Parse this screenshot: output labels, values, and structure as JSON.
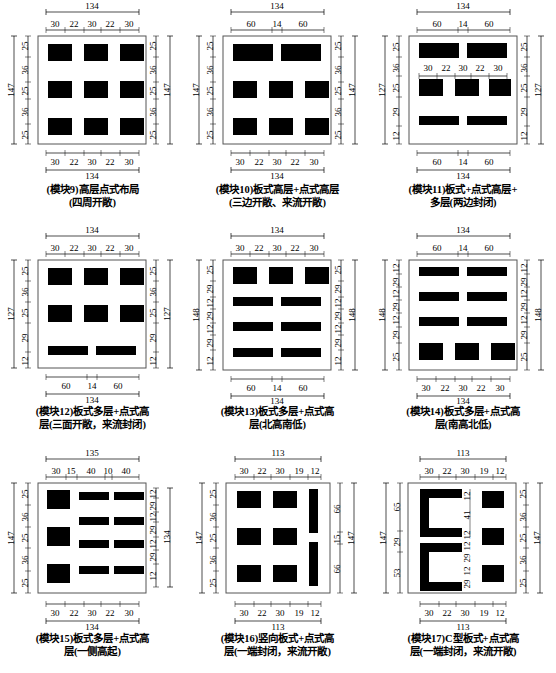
{
  "figure": {
    "type": "technical-diagram",
    "rows": 3,
    "cols": 3
  },
  "modules": [
    {
      "id": "module-9",
      "caption_line1": "(模块9)高层点式布局",
      "caption_line2": "(四周开敞)",
      "top_total": "134",
      "top_segments": [
        "30",
        "22",
        "30",
        "22",
        "30"
      ],
      "bottom_total": "134",
      "bottom_segments": [
        "30",
        "22",
        "30",
        "22",
        "30"
      ],
      "left_total": "147",
      "left_segments": [
        "25",
        "36",
        "25",
        "36",
        "25"
      ],
      "right_total": "147",
      "right_segments": [
        "25",
        "36",
        "25",
        "36",
        "25"
      ],
      "blocks": [
        {
          "x": 10,
          "y": 8,
          "w": 24,
          "h": 17
        },
        {
          "x": 46,
          "y": 8,
          "w": 24,
          "h": 17
        },
        {
          "x": 82,
          "y": 8,
          "w": 24,
          "h": 17
        },
        {
          "x": 10,
          "y": 45,
          "w": 24,
          "h": 17
        },
        {
          "x": 46,
          "y": 45,
          "w": 24,
          "h": 17
        },
        {
          "x": 82,
          "y": 45,
          "w": 24,
          "h": 17
        },
        {
          "x": 10,
          "y": 82,
          "w": 24,
          "h": 17
        },
        {
          "x": 46,
          "y": 82,
          "w": 24,
          "h": 17
        },
        {
          "x": 82,
          "y": 82,
          "w": 24,
          "h": 17
        }
      ]
    },
    {
      "id": "module-10",
      "caption_line1": "(模块10)板式高层+点式高层",
      "caption_line2": "(三边开敞、来流开敞)",
      "top_total": "134",
      "top_segments": [
        "60",
        "14",
        "60"
      ],
      "bottom_total": "134",
      "bottom_segments": [
        "30",
        "22",
        "30",
        "22",
        "30"
      ],
      "left_total": "147",
      "left_segments": [
        "25",
        "36",
        "25",
        "36",
        "25"
      ],
      "right_total": "147",
      "right_segments": [
        "25",
        "36",
        "25",
        "36",
        "25"
      ],
      "blocks": [
        {
          "x": 10,
          "y": 8,
          "w": 49,
          "h": 17
        },
        {
          "x": 66,
          "y": 8,
          "w": 49,
          "h": 17
        },
        {
          "x": 10,
          "y": 45,
          "w": 24,
          "h": 17
        },
        {
          "x": 46,
          "y": 45,
          "w": 24,
          "h": 17
        },
        {
          "x": 82,
          "y": 45,
          "w": 24,
          "h": 17
        },
        {
          "x": 10,
          "y": 82,
          "w": 24,
          "h": 17
        },
        {
          "x": 46,
          "y": 82,
          "w": 24,
          "h": 17
        },
        {
          "x": 82,
          "y": 82,
          "w": 24,
          "h": 17
        }
      ]
    },
    {
      "id": "module-11",
      "caption_line1": "(模块11)板式+点式高层+",
      "caption_line2": "多层(两边封闭)",
      "top_total": "134",
      "top_segments": [
        "60",
        "14",
        "60"
      ],
      "bottom_total": "134",
      "bottom_segments": [
        "60",
        "14",
        "60"
      ],
      "left_total": "127",
      "left_segments": [
        "25",
        "36",
        "25",
        "29",
        "12"
      ],
      "right_total": "127",
      "right_segments": [
        "25",
        "36",
        "25",
        "29",
        "12"
      ],
      "inner_segments": [
        "30",
        "22",
        "30",
        "22",
        "30"
      ],
      "blocks": [
        {
          "x": 10,
          "y": 8,
          "w": 49,
          "h": 15
        },
        {
          "x": 66,
          "y": 8,
          "w": 49,
          "h": 15
        },
        {
          "x": 10,
          "y": 44,
          "w": 24,
          "h": 17
        },
        {
          "x": 46,
          "y": 44,
          "w": 24,
          "h": 17
        },
        {
          "x": 82,
          "y": 44,
          "w": 24,
          "h": 17
        },
        {
          "x": 10,
          "y": 80,
          "w": 49,
          "h": 9
        },
        {
          "x": 66,
          "y": 80,
          "w": 49,
          "h": 9
        }
      ]
    },
    {
      "id": "module-12",
      "caption_line1": "(模块12)板式多层+点式高",
      "caption_line2": "层(三面开敞，来流封闭)",
      "top_total": "134",
      "top_segments": [
        "30",
        "22",
        "30",
        "22",
        "30"
      ],
      "bottom_total": "134",
      "bottom_segments": [
        "60",
        "14",
        "60"
      ],
      "left_total": "127",
      "left_segments": [
        "25",
        "36",
        "25",
        "29",
        "12"
      ],
      "right_total": "127",
      "right_segments": [
        "25",
        "36",
        "25",
        "29",
        "12"
      ],
      "blocks": [
        {
          "x": 10,
          "y": 8,
          "w": 24,
          "h": 17
        },
        {
          "x": 46,
          "y": 8,
          "w": 24,
          "h": 17
        },
        {
          "x": 82,
          "y": 8,
          "w": 24,
          "h": 17
        },
        {
          "x": 10,
          "y": 45,
          "w": 24,
          "h": 17
        },
        {
          "x": 46,
          "y": 45,
          "w": 24,
          "h": 17
        },
        {
          "x": 82,
          "y": 45,
          "w": 24,
          "h": 17
        },
        {
          "x": 10,
          "y": 84,
          "w": 49,
          "h": 9
        },
        {
          "x": 66,
          "y": 84,
          "w": 49,
          "h": 9
        }
      ]
    },
    {
      "id": "module-13",
      "caption_line1": "(模块13)板式多层+点式高",
      "caption_line2": "层(北高南低)",
      "top_total": "134",
      "top_segments": [
        "30",
        "22",
        "30",
        "22",
        "30"
      ],
      "bottom_total": "134",
      "bottom_segments": [
        "60",
        "14",
        "60"
      ],
      "left_total": "148",
      "left_segments": [
        "25",
        "29",
        "12",
        "29",
        "12",
        "29",
        "12"
      ],
      "right_total": "148",
      "right_segments": [
        "25",
        "29",
        "12",
        "29",
        "12",
        "29",
        "12"
      ],
      "blocks": [
        {
          "x": 10,
          "y": 7,
          "w": 24,
          "h": 17
        },
        {
          "x": 46,
          "y": 7,
          "w": 24,
          "h": 17
        },
        {
          "x": 82,
          "y": 7,
          "w": 24,
          "h": 17
        },
        {
          "x": 10,
          "y": 38,
          "w": 49,
          "h": 9
        },
        {
          "x": 66,
          "y": 38,
          "w": 49,
          "h": 9
        },
        {
          "x": 10,
          "y": 63,
          "w": 49,
          "h": 9
        },
        {
          "x": 66,
          "y": 63,
          "w": 49,
          "h": 9
        },
        {
          "x": 10,
          "y": 88,
          "w": 49,
          "h": 9
        },
        {
          "x": 66,
          "y": 88,
          "w": 49,
          "h": 9
        }
      ]
    },
    {
      "id": "module-14",
      "caption_line1": "(模块14)板式多层+点式高",
      "caption_line2": "层(南高北低)",
      "top_total": "134",
      "top_segments": [
        "60",
        "14",
        "60"
      ],
      "bottom_total": "134",
      "bottom_segments": [
        "30",
        "22",
        "30",
        "22",
        "30"
      ],
      "left_total": "148",
      "left_segments": [
        "12",
        "29",
        "12",
        "29",
        "12",
        "29",
        "25"
      ],
      "right_total": "148",
      "right_segments": [
        "12",
        "29",
        "12",
        "29",
        "12",
        "29",
        "25"
      ],
      "blocks": [
        {
          "x": 10,
          "y": 7,
          "w": 49,
          "h": 9
        },
        {
          "x": 66,
          "y": 7,
          "w": 49,
          "h": 9
        },
        {
          "x": 10,
          "y": 32,
          "w": 49,
          "h": 9
        },
        {
          "x": 66,
          "y": 32,
          "w": 49,
          "h": 9
        },
        {
          "x": 10,
          "y": 57,
          "w": 49,
          "h": 9
        },
        {
          "x": 66,
          "y": 57,
          "w": 49,
          "h": 9
        },
        {
          "x": 10,
          "y": 80,
          "w": 24,
          "h": 17
        },
        {
          "x": 46,
          "y": 80,
          "w": 24,
          "h": 17
        },
        {
          "x": 82,
          "y": 80,
          "w": 24,
          "h": 17
        }
      ]
    },
    {
      "id": "module-15",
      "caption_line1": "(模块15)板式多层+点式高",
      "caption_line2": "层(一侧高起)",
      "top_total": "135",
      "top_segments": [
        "30",
        "15",
        "40",
        "10",
        "40"
      ],
      "bottom_total": "134",
      "bottom_segments": [
        "30",
        "22",
        "30",
        "22",
        "30"
      ],
      "left_total": "147",
      "left_segments": [
        "25",
        "36",
        "25",
        "36",
        "25"
      ],
      "right_total": "134",
      "right_segments": [
        "12",
        "29",
        "12",
        "29",
        "12",
        "29",
        "12"
      ],
      "blocks": [
        {
          "x": 10,
          "y": 7,
          "w": 24,
          "h": 19
        },
        {
          "x": 45,
          "y": 9,
          "w": 31,
          "h": 8
        },
        {
          "x": 84,
          "y": 9,
          "w": 31,
          "h": 8
        },
        {
          "x": 10,
          "y": 44,
          "w": 24,
          "h": 19
        },
        {
          "x": 45,
          "y": 34,
          "w": 31,
          "h": 8
        },
        {
          "x": 84,
          "y": 34,
          "w": 31,
          "h": 8
        },
        {
          "x": 45,
          "y": 57,
          "w": 31,
          "h": 8
        },
        {
          "x": 84,
          "y": 57,
          "w": 31,
          "h": 8
        },
        {
          "x": 10,
          "y": 80,
          "w": 24,
          "h": 19
        },
        {
          "x": 45,
          "y": 82,
          "w": 31,
          "h": 8
        },
        {
          "x": 84,
          "y": 82,
          "w": 31,
          "h": 8
        }
      ]
    },
    {
      "id": "module-16",
      "caption_line1": "(模块16)竖向板式+点式高",
      "caption_line2": "层(一端封闭，来流开敞)",
      "top_total": "113",
      "top_segments": [
        "30",
        "22",
        "30",
        "19",
        "12"
      ],
      "bottom_total": "113",
      "bottom_segments": [
        "30",
        "22",
        "30",
        "19",
        "12"
      ],
      "left_total": "147",
      "left_segments": [
        "25",
        "36",
        "25",
        "36",
        "25"
      ],
      "right_total": "147",
      "right_segments": [
        "66",
        "15",
        "66"
      ],
      "blocks": [
        {
          "x": 10,
          "y": 8,
          "w": 24,
          "h": 17
        },
        {
          "x": 46,
          "y": 8,
          "w": 24,
          "h": 17
        },
        {
          "x": 10,
          "y": 45,
          "w": 24,
          "h": 17
        },
        {
          "x": 46,
          "y": 45,
          "w": 24,
          "h": 17
        },
        {
          "x": 10,
          "y": 82,
          "w": 24,
          "h": 17
        },
        {
          "x": 46,
          "y": 82,
          "w": 24,
          "h": 17
        },
        {
          "x": 88,
          "y": 6,
          "w": 9,
          "h": 45
        },
        {
          "x": 88,
          "y": 56,
          "w": 9,
          "h": 45
        }
      ]
    },
    {
      "id": "module-17",
      "caption_line1": "(模块17)C型板式+点式高",
      "caption_line2": "层(一端封闭，来流开敞)",
      "top_total": "113",
      "top_segments": [
        "30",
        "22",
        "30",
        "19",
        "12"
      ],
      "bottom_total": "113",
      "bottom_segments": [
        "30",
        "22",
        "30",
        "19",
        "12"
      ],
      "left_total": "147",
      "left_segments": [
        "65",
        "29",
        "53"
      ],
      "right_total": "147",
      "right_segments": [
        "25",
        "36",
        "25",
        "36",
        "25"
      ],
      "inner_vertical": [
        "12",
        "41",
        "12",
        "12",
        "29",
        "12",
        "29"
      ],
      "blocks": [
        {
          "x": 10,
          "y": 6,
          "w": 54,
          "h": 9
        },
        {
          "x": 10,
          "y": 6,
          "w": 9,
          "h": 41
        },
        {
          "x": 10,
          "y": 38,
          "w": 54,
          "h": 9
        },
        {
          "x": 10,
          "y": 60,
          "w": 54,
          "h": 9
        },
        {
          "x": 10,
          "y": 60,
          "w": 9,
          "h": 41
        },
        {
          "x": 10,
          "y": 92,
          "w": 54,
          "h": 9
        },
        {
          "x": 78,
          "y": 8,
          "w": 22,
          "h": 17
        },
        {
          "x": 78,
          "y": 45,
          "w": 22,
          "h": 17
        },
        {
          "x": 78,
          "y": 82,
          "w": 22,
          "h": 17
        }
      ]
    }
  ]
}
